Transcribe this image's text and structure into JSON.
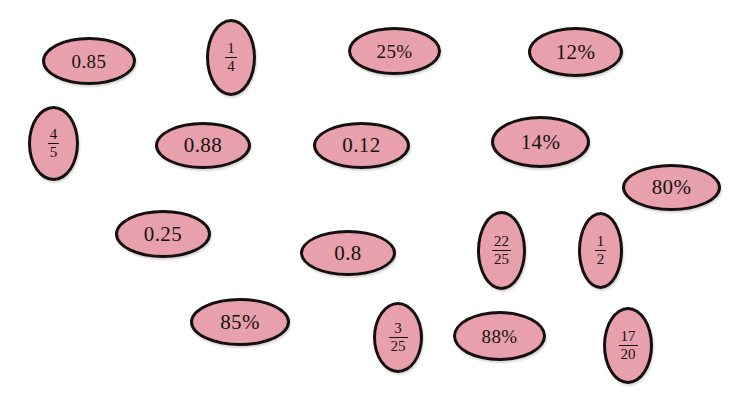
{
  "page": {
    "background_color": "#ffffff",
    "oval_fill_color": "#e9a0ad",
    "oval_border_color": "#14100f",
    "text_color": "#17120f",
    "width": 739,
    "height": 406
  },
  "ovals": [
    {
      "id": "oval-0-85",
      "kind": "decimal",
      "text": "0.85",
      "x": 42,
      "y": 37,
      "w": 94,
      "h": 48
    },
    {
      "id": "oval-1-4",
      "kind": "fraction",
      "numerator": "1",
      "denominator": "4",
      "text": "1/4",
      "x": 206,
      "y": 19,
      "w": 50,
      "h": 77
    },
    {
      "id": "oval-25-pct",
      "kind": "percent",
      "text": "25%",
      "x": 348,
      "y": 27,
      "w": 93,
      "h": 48
    },
    {
      "id": "oval-12-pct",
      "kind": "percent",
      "text": "12%",
      "x": 528,
      "y": 27,
      "w": 95,
      "h": 50
    },
    {
      "id": "oval-4-5",
      "kind": "fraction",
      "numerator": "4",
      "denominator": "5",
      "text": "4/5",
      "x": 28,
      "y": 106,
      "w": 51,
      "h": 75
    },
    {
      "id": "oval-0-88",
      "kind": "decimal",
      "text": "0.88",
      "x": 155,
      "y": 122,
      "w": 96,
      "h": 47
    },
    {
      "id": "oval-0-12",
      "kind": "decimal",
      "text": "0.12",
      "x": 313,
      "y": 122,
      "w": 97,
      "h": 47
    },
    {
      "id": "oval-14-pct",
      "kind": "percent",
      "text": "14%",
      "x": 491,
      "y": 116,
      "w": 99,
      "h": 52
    },
    {
      "id": "oval-80-pct",
      "kind": "percent",
      "text": "80%",
      "x": 622,
      "y": 164,
      "w": 99,
      "h": 47
    },
    {
      "id": "oval-0-25",
      "kind": "decimal",
      "text": "0.25",
      "x": 115,
      "y": 210,
      "w": 96,
      "h": 48
    },
    {
      "id": "oval-0-8",
      "kind": "decimal",
      "text": "0.8",
      "x": 300,
      "y": 230,
      "w": 96,
      "h": 46
    },
    {
      "id": "oval-22-25",
      "kind": "fraction",
      "numerator": "22",
      "denominator": "25",
      "text": "22/25",
      "x": 477,
      "y": 211,
      "w": 49,
      "h": 79
    },
    {
      "id": "oval-1-2",
      "kind": "fraction",
      "numerator": "1",
      "denominator": "2",
      "text": "1/2",
      "x": 578,
      "y": 212,
      "w": 45,
      "h": 77
    },
    {
      "id": "oval-85-pct",
      "kind": "percent",
      "text": "85%",
      "x": 190,
      "y": 298,
      "w": 100,
      "h": 48
    },
    {
      "id": "oval-3-25",
      "kind": "fraction",
      "numerator": "3",
      "denominator": "25",
      "text": "3/25",
      "x": 373,
      "y": 302,
      "w": 50,
      "h": 71
    },
    {
      "id": "oval-88-pct",
      "kind": "percent",
      "text": "88%",
      "x": 453,
      "y": 311,
      "w": 93,
      "h": 50
    },
    {
      "id": "oval-17-20",
      "kind": "fraction",
      "numerator": "17",
      "denominator": "20",
      "text": "17/20",
      "x": 603,
      "y": 307,
      "w": 50,
      "h": 77
    }
  ]
}
